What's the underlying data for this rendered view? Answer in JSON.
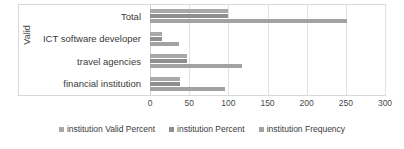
{
  "chart_data": {
    "type": "bar",
    "orientation": "horizontal",
    "title": "",
    "xlabel": "",
    "ylabel": "Valid",
    "categories": [
      "Total",
      "ICT software developer",
      "travel agencies",
      "financial institution"
    ],
    "series": [
      {
        "name": "institution Valid Percent",
        "values": [
          100,
          14.7,
          47.0,
          38.2
        ],
        "color": "#a8a8a8"
      },
      {
        "name": "institution Percent",
        "values": [
          100,
          14.7,
          47.0,
          38.2
        ],
        "color": "#8f8f8f"
      },
      {
        "name": "institution Frequency",
        "values": [
          251,
          37,
          118,
          96
        ],
        "color": "#a2a2a2"
      }
    ],
    "xlim": [
      0,
      300
    ],
    "xticks": [
      0,
      50,
      100,
      150,
      200,
      250,
      300
    ],
    "grid": true,
    "legend_position": "bottom"
  },
  "axis": {
    "y_title": "Valid",
    "tick_labels": [
      "0",
      "50",
      "100",
      "150",
      "200",
      "250",
      "300"
    ]
  },
  "legend": {
    "items": [
      {
        "label": "institution Valid Percent"
      },
      {
        "label": "institution Percent"
      },
      {
        "label": "institution Frequency"
      }
    ]
  }
}
